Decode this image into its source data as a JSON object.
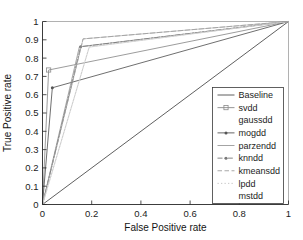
{
  "chart_data": {
    "type": "line",
    "title": "",
    "xlabel": "False Positive rate",
    "ylabel": "True Positive rate",
    "xlim": [
      0,
      1
    ],
    "ylim": [
      0,
      1
    ],
    "grid": false,
    "legend_position": "lower right",
    "xticks": [
      "0",
      "0.2",
      "0.4",
      "0.6",
      "0.8",
      "1"
    ],
    "xtick_values": [
      0,
      0.2,
      0.4,
      0.6,
      0.8,
      1
    ],
    "yticks": [
      "0",
      "0.1",
      "0.2",
      "0.3",
      "0.4",
      "0.5",
      "0.6",
      "0.7",
      "0.8",
      "0.9",
      "1"
    ],
    "ytick_values": [
      0,
      0.1,
      0.2,
      0.3,
      0.4,
      0.5,
      0.6,
      0.7,
      0.8,
      0.9,
      1
    ],
    "series": [
      {
        "name": "Baseline",
        "color": "#4d4d4d",
        "dash": "none",
        "marker": "none",
        "x": [
          0,
          1
        ],
        "y": [
          0,
          1
        ]
      },
      {
        "name": "svdd",
        "color": "#8a8a8a",
        "dash": "none",
        "marker": "square",
        "x": [
          0,
          0.025,
          1
        ],
        "y": [
          0,
          0.735,
          1
        ]
      },
      {
        "name": "gaussdd",
        "color": "#bdbdbd",
        "dash": "none",
        "marker": "none",
        "x": [
          0,
          0.165,
          1
        ],
        "y": [
          0,
          0.905,
          1
        ]
      },
      {
        "name": "mogdd",
        "color": "#555555",
        "dash": "none",
        "marker": "dot",
        "x": [
          0,
          0.04,
          1
        ],
        "y": [
          0,
          0.638,
          1
        ]
      },
      {
        "name": "parzendd",
        "color": "#9a9a9a",
        "dash": "none",
        "marker": "none",
        "x": [
          0,
          0.15,
          1
        ],
        "y": [
          0,
          0.862,
          1
        ]
      },
      {
        "name": "knndd",
        "color": "#777777",
        "dash": "dashdot",
        "marker": "dot",
        "x": [
          0,
          0.155,
          1
        ],
        "y": [
          0,
          0.862,
          1
        ]
      },
      {
        "name": "kmeansdd",
        "color": "#9e9e9e",
        "dash": "dashed",
        "marker": "none",
        "x": [
          0,
          0.165,
          1
        ],
        "y": [
          0,
          0.905,
          1
        ]
      },
      {
        "name": "lpdd",
        "color": "#c2c2c2",
        "dash": "dotted",
        "marker": "none",
        "x": [
          0,
          0.19,
          1
        ],
        "y": [
          0,
          0.862,
          1
        ]
      },
      {
        "name": "mstdd",
        "color": "#d0d0d0",
        "dash": "none",
        "marker": "none",
        "x": [
          0,
          0.19,
          1
        ],
        "y": [
          0,
          0.86,
          1
        ]
      }
    ]
  },
  "axes": {
    "x_title": "False Positive rate",
    "y_title": "True Positive rate"
  },
  "legend": {
    "entries": [
      {
        "label": "Baseline"
      },
      {
        "label": "svdd"
      },
      {
        "label": "gaussdd"
      },
      {
        "label": "mogdd"
      },
      {
        "label": "parzendd"
      },
      {
        "label": "knndd"
      },
      {
        "label": "kmeansdd"
      },
      {
        "label": "lpdd"
      },
      {
        "label": "mstdd"
      }
    ]
  }
}
